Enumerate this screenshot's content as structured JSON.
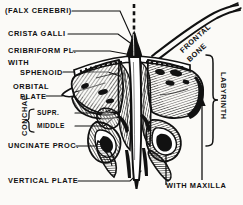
{
  "figure": {
    "view": "posterior",
    "background_color": "#fbfaf7",
    "ink_color": "#111111"
  },
  "labels": {
    "falx_cerebri": "(FALX CEREBRI)",
    "crista_galli": "CRISTA GALLI",
    "cribriform_plate": "CRIBRIFORM PL.",
    "with_sphenoid_line1": "WITH",
    "with_sphenoid_line2": "SPHENOID",
    "orbital_plate_line1": "ORBITAL",
    "orbital_plate_line2": "PLATE",
    "conchae": "CONCHAE",
    "conchae_superior": "SUPR.",
    "conchae_middle": "MIDDLE",
    "uncinate_process": "UNCINATE PROC.",
    "vertical_plate": "VERTICAL PLATE",
    "frontal_bone_line1": "FRONTAL",
    "frontal_bone_line2": "BONE",
    "labyrinth": "LABYRINTH",
    "with_maxilla": "WITH MAXILLA"
  }
}
